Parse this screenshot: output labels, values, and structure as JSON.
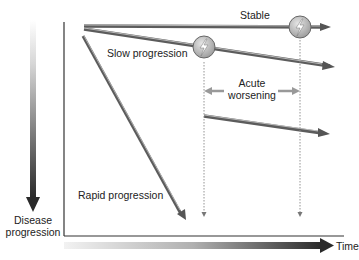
{
  "diagram": {
    "y_axis_label_line1": "Disease",
    "y_axis_label_line2": "progression",
    "x_axis_label": "Time",
    "trajectories": [
      {
        "id": "stable",
        "label": "Stable"
      },
      {
        "id": "slow",
        "label": "Slow progression"
      },
      {
        "id": "rapid",
        "label": "Rapid progression"
      }
    ],
    "event_label_line1": "Acute",
    "event_label_line2": "worsening",
    "event_icon": "lightning-bolt-icon",
    "colors": {
      "line_dark": "#555555",
      "line_light": "#cfcfcf",
      "circle_fill": "#b8b8b8",
      "axis": "#333333",
      "dotted": "#888888"
    }
  }
}
